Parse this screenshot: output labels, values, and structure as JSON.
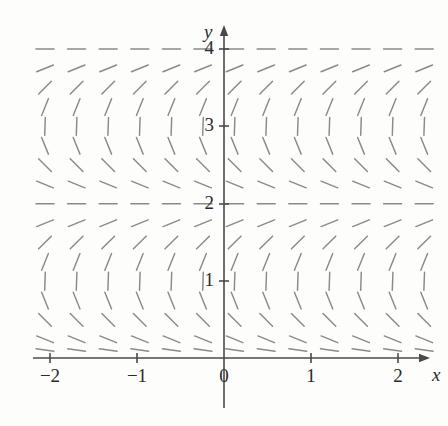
{
  "figure": {
    "kind": "slope-field",
    "background_color": "#fdfdfc",
    "axis_color": "#4a4a4a",
    "segment_color": "#8a8a8a",
    "label_color": "#2b2b2b"
  },
  "axes": {
    "x_axis_label": "x",
    "y_axis_label": "y",
    "origin_px": {
      "x": 224,
      "y": 358
    },
    "unit_px": {
      "x": 87,
      "y": 77.5
    },
    "x_ticks": [
      {
        "value": -2,
        "label": "−2",
        "px": 50
      },
      {
        "value": -1,
        "label": "−1",
        "px": 137
      },
      {
        "value": 0,
        "label": "0",
        "px": 224
      },
      {
        "value": 1,
        "label": "1",
        "px": 311
      },
      {
        "value": 2,
        "label": "2",
        "px": 398
      }
    ],
    "y_ticks": [
      {
        "value": 1,
        "label": "1",
        "px": 281
      },
      {
        "value": 2,
        "label": "2",
        "px": 204
      },
      {
        "value": 3,
        "label": "3",
        "px": 126
      },
      {
        "value": 4,
        "label": "4",
        "px": 49
      }
    ],
    "x_axis_range_px": {
      "start": 33,
      "end": 430
    },
    "y_axis_range_px": {
      "start": 25,
      "end": 408
    },
    "x_arrow": "right",
    "y_arrow": "up"
  },
  "chart_data": {
    "type": "scatter",
    "title": "",
    "xlabel": "x",
    "ylabel": "y",
    "xlim": [
      -2.3,
      2.35
    ],
    "ylim": [
      -0.15,
      4.3
    ],
    "grid": false,
    "legend": null,
    "slope_rule": {
      "independent_of_x": true,
      "zero_slope_at_y": [
        0,
        2,
        4
      ],
      "infinite_slope_at_y": [
        1,
        3
      ],
      "period_in_y": 2
    },
    "grid_px": {
      "x_start": 45.0,
      "x_step": 31.6,
      "x_count": 13,
      "y_start": 49.0,
      "y_step": 19.35,
      "y_count": 17
    },
    "segment_half_length_px": 9.0,
    "segment_rows": [
      {
        "y_value": 4.0,
        "y_px": 49.0,
        "angle_deg": 0
      },
      {
        "y_value": 3.75,
        "y_px": 68.4,
        "angle_deg": -22
      },
      {
        "y_value": 3.5,
        "y_px": 87.7,
        "angle_deg": -45
      },
      {
        "y_value": 3.25,
        "y_px": 107.1,
        "angle_deg": -68
      },
      {
        "y_value": 3.0,
        "y_px": 126.4,
        "angle_deg": -88
      },
      {
        "y_value": 2.75,
        "y_px": 145.8,
        "angle_deg": 68
      },
      {
        "y_value": 2.5,
        "y_px": 165.1,
        "angle_deg": 45
      },
      {
        "y_value": 2.25,
        "y_px": 184.5,
        "angle_deg": 22
      },
      {
        "y_value": 2.0,
        "y_px": 203.8,
        "angle_deg": 0
      },
      {
        "y_value": 1.75,
        "y_px": 223.2,
        "angle_deg": -22
      },
      {
        "y_value": 1.5,
        "y_px": 242.5,
        "angle_deg": -45
      },
      {
        "y_value": 1.25,
        "y_px": 261.9,
        "angle_deg": -68
      },
      {
        "y_value": 1.0,
        "y_px": 281.2,
        "angle_deg": -88
      },
      {
        "y_value": 0.75,
        "y_px": 300.6,
        "angle_deg": 68
      },
      {
        "y_value": 0.5,
        "y_px": 319.9,
        "angle_deg": 45
      },
      {
        "y_value": 0.25,
        "y_px": 339.3,
        "angle_deg": 22
      },
      {
        "y_value": 0.1,
        "y_px": 350.0,
        "angle_deg": 8
      }
    ]
  }
}
